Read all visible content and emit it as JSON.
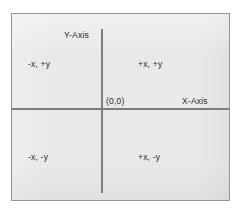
{
  "diagram": {
    "axis_labels": {
      "y": "Y-Axis",
      "x": "X-Axis"
    },
    "origin_label": "(0,0)",
    "quadrants": [
      {
        "name": "quadrant-1",
        "label": "+x, +y"
      },
      {
        "name": "quadrant-2",
        "label": "-x, +y"
      },
      {
        "name": "quadrant-3",
        "label": "-x, -y"
      },
      {
        "name": "quadrant-4",
        "label": "+x, -y"
      }
    ],
    "colors": {
      "page_background": "#ffffff",
      "plot_fill": "#e9e9e9",
      "plot_border": "#959595",
      "axis_line": "#7d7d7d",
      "label_text": "#2b2b2b"
    }
  },
  "chart_data": {
    "type": "scatter",
    "xlabel": "X-Axis",
    "ylabel": "Y-Axis",
    "grid": false,
    "legend": "none",
    "xlim": [
      -1,
      1
    ],
    "ylim": [
      -1,
      1
    ],
    "x": [],
    "y": [],
    "annotations": [
      {
        "text": "Y-Axis",
        "x": -0.12,
        "y": 0.92,
        "role": "axis-label"
      },
      {
        "text": "X-Axis",
        "x": 0.78,
        "y": 0.1,
        "role": "axis-label"
      },
      {
        "text": "(0,0)",
        "x": 0.06,
        "y": 0.1,
        "role": "origin-label"
      },
      {
        "text": "-x, +y",
        "x": -0.62,
        "y": 0.5,
        "role": "quadrant-label"
      },
      {
        "text": "+x, +y",
        "x": 0.38,
        "y": 0.5,
        "role": "quadrant-label"
      },
      {
        "text": "-x, -y",
        "x": -0.62,
        "y": -0.5,
        "role": "quadrant-label"
      },
      {
        "text": "+x, -y",
        "x": 0.38,
        "y": -0.5,
        "role": "quadrant-label"
      }
    ]
  }
}
